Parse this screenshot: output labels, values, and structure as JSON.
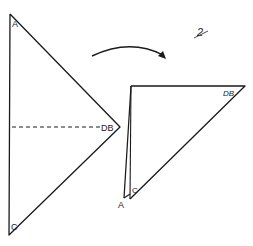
{
  "diagram": {
    "step_number": "2",
    "left_triangle": {
      "labels": {
        "top": "A",
        "right": "DB",
        "bottom": "C"
      },
      "fold_line": "dashed"
    },
    "arrow": {
      "direction": "right",
      "shape": "curved"
    },
    "right_triangle": {
      "labels": {
        "top_right": "DB",
        "bottom_left_outer": "A",
        "bottom_left_inner": "C"
      }
    },
    "colors": {
      "stroke": "#1a1a1a",
      "background": "#ffffff"
    }
  }
}
